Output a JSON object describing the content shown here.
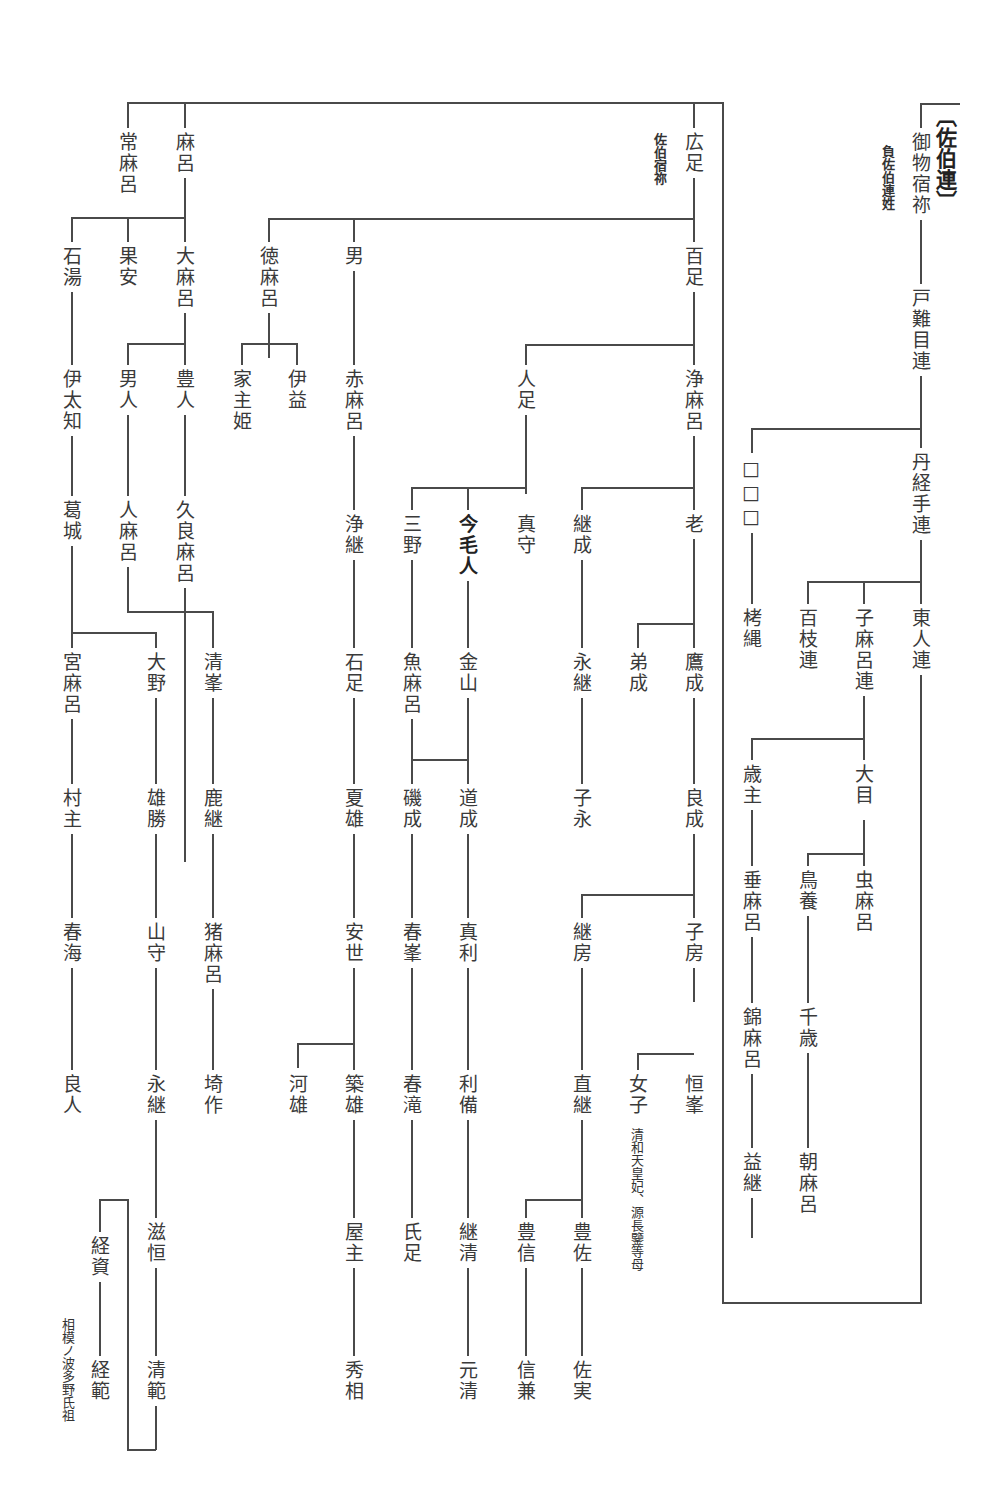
{
  "heading": "〔佐伯連〕",
  "notes": {
    "kabane_note": "負佐伯連姓",
    "hirotari_note": "佐伯宿祢",
    "nyoshi_note": "清和天皇妃、源長鑒等母",
    "tsunenori_note": "相模ノ波多野氏祖"
  },
  "nodes": {
    "mimono_sukune": "御物宿祢",
    "tonamemuraji": "戸難目連",
    "nifutemuraji": "丹経手連",
    "unknown": "□□□",
    "kunawa": "栲縄",
    "hyakushi": "百枝連",
    "komaro": "子麻呂連",
    "azumahito": "東人連",
    "toshinushi": "歳主",
    "oome": "大目",
    "tarimaro": "垂麻呂",
    "torikai": "鳥養",
    "mushimaro": "虫麻呂",
    "nishikimaro": "錦麻呂",
    "chitose": "千歳",
    "masutsugu": "益継",
    "asamaro": "朝麻呂",
    "hirotari": "広足",
    "momotari": "百足",
    "hitotari": "人足",
    "kiyomaro": "浄麻呂",
    "mitsumori": "真守",
    "imaemishi": "今毛人",
    "mino": "三野",
    "tsugunari": "継成",
    "oi": "老",
    "kanayama": "金山",
    "uomaro": "魚麻呂",
    "nagatsugu1": "永継",
    "otonari": "弟成",
    "takanari": "鷹成",
    "michinari": "道成",
    "isonari": "磯成",
    "konaga": "子永",
    "yoshinari": "良成",
    "masatoshi": "真利",
    "harumine": "春峯",
    "tsugufusa": "継房",
    "kofusa": "子房",
    "toshinari": "利備",
    "harutaki": "春滝",
    "naotsugu": "直継",
    "nyoshi": "女子",
    "tsunemine": "恒峯",
    "tsugukiyo": "継清",
    "ujitari": "氏足",
    "toyonobu": "豊信",
    "toyosuke": "豊佐",
    "motokiyo": "元清",
    "nobukane": "信兼",
    "sukezane": "佐実",
    "tokumaro": "徳麻呂",
    "otoko": "男",
    "ieyosihime": "家主姫",
    "imasu": "伊益",
    "akamaro": "赤麻呂",
    "kiyotsugu": "浄継",
    "iwatari": "石足",
    "natsuo": "夏雄",
    "yasuyo": "安世",
    "kawao": "河雄",
    "tsukio": "築雄",
    "yanushi": "屋主",
    "hidesuke": "秀相",
    "tsunemaro": "常麻呂",
    "maro": "麻呂",
    "iwayu": "石湯",
    "kayasu": "果安",
    "oomaro": "大麻呂",
    "itachi": "伊太知",
    "otohito": "男人",
    "toyohito": "豊人",
    "katsuragi": "葛城",
    "hitomaro": "人麻呂",
    "kuramaro": "久良麻呂",
    "miyamaro": "宮麻呂",
    "oono": "大野",
    "kiyomine": "清峯",
    "murashi": "村主",
    "okatsu": "雄勝",
    "shikatsugu": "鹿継",
    "harumi": "春海",
    "yamamori": "山守",
    "imaro": "猪麻呂",
    "yoshihito": "良人",
    "nagatsugu2": "永継",
    "sakitsukuri": "埼作",
    "shigetsune": "滋恒",
    "tsunesuke": "経資",
    "kiyonori": "清範",
    "tsunenori": "経範"
  }
}
